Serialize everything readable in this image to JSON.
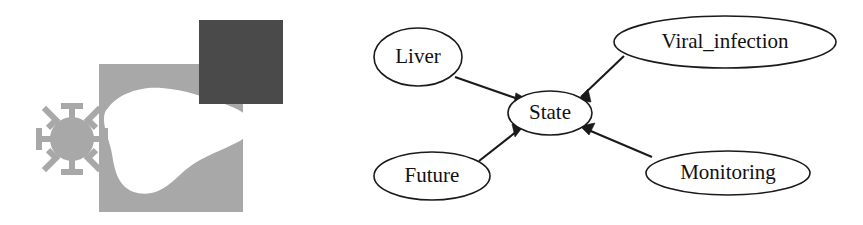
{
  "figure": {
    "width": 863,
    "height": 225,
    "background": "#ffffff"
  },
  "icon_panel": {
    "name": "liver-virus-icon",
    "description": "Stylized liver organ silhouette with overlapping squares and a virus particle",
    "colors": {
      "light_square": "#a8a8a8",
      "dark_square": "#4a4a4a",
      "liver_silhouette": "#ffffff",
      "virus": "#a8a8a8"
    },
    "shapes": {
      "light_square_label": "light-gray-square",
      "dark_square_label": "dark-gray-square",
      "liver_label": "liver-silhouette",
      "virus_label": "virus-particle"
    }
  },
  "graph": {
    "type": "directed-graph",
    "label": "bayesian-network",
    "nodes": [
      {
        "id": "liver",
        "label": "Liver",
        "cx": 418,
        "cy": 57,
        "rx": 44,
        "ry": 29,
        "font_size": 21
      },
      {
        "id": "viral_infection",
        "label": "Viral_infection",
        "cx": 725,
        "cy": 42,
        "rx": 111,
        "ry": 26,
        "font_size": 21
      },
      {
        "id": "state",
        "label": "State",
        "cx": 550,
        "cy": 113,
        "rx": 42,
        "ry": 22,
        "font_size": 21
      },
      {
        "id": "future",
        "label": "Future",
        "cx": 432,
        "cy": 176,
        "rx": 58,
        "ry": 24,
        "font_size": 21
      },
      {
        "id": "monitoring",
        "label": "Monitoring",
        "cx": 728,
        "cy": 173,
        "rx": 82,
        "ry": 22,
        "font_size": 21
      }
    ],
    "edges": [
      {
        "from": "liver",
        "to": "state",
        "x1": 455,
        "y1": 77,
        "x2": 518,
        "y2": 99,
        "label": "edge-liver-state"
      },
      {
        "from": "viral_infection",
        "to": "state",
        "x1": 622,
        "y1": 57,
        "x2": 582,
        "y2": 96,
        "label": "edge-viral-infection-state"
      },
      {
        "from": "future",
        "to": "state",
        "x1": 480,
        "y1": 160,
        "x2": 519,
        "y2": 130,
        "label": "edge-future-state"
      },
      {
        "from": "monitoring",
        "to": "state",
        "x1": 650,
        "y1": 158,
        "x2": 584,
        "y2": 130,
        "label": "edge-monitoring-state"
      }
    ],
    "edge_color": "#1a1a1a",
    "node_fill": "#ffffff",
    "node_stroke": "#1a1a1a"
  }
}
